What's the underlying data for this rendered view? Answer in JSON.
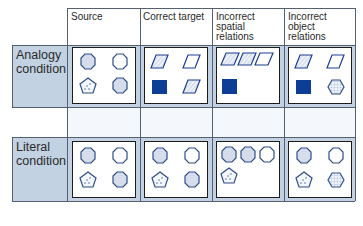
{
  "columns": [
    {
      "label": "Source"
    },
    {
      "label": "Correct target"
    },
    {
      "label": "Incorrect\nspatial\nrelations",
      "lines": [
        "Incorrect",
        "spatial",
        "relations"
      ]
    },
    {
      "label": "Incorrect\nobject\nrelations",
      "lines": [
        "Incorrect",
        "object",
        "relations"
      ]
    }
  ],
  "rows": [
    {
      "label_lines": [
        "Analogy",
        "condition"
      ],
      "panels": [
        {
          "column": "Source",
          "shapes": [
            "octagon-dotted",
            "octagon-empty",
            "pentagon-dots",
            "octagon-dotted"
          ]
        },
        {
          "column": "Correct target",
          "shapes": [
            "parallelogram-striped",
            "parallelogram-empty",
            "square-filled",
            "parallelogram-striped"
          ]
        },
        {
          "column": "Incorrect spatial relations",
          "shapes": [
            "parallelogram-striped",
            "parallelogram-striped",
            "parallelogram-empty",
            "square-filled"
          ]
        },
        {
          "column": "Incorrect object relations",
          "shapes": [
            "parallelogram-striped",
            "parallelogram-empty",
            "square-filled",
            "hexagon-grid"
          ]
        }
      ]
    },
    {
      "label_lines": [
        "Literal",
        "condition"
      ],
      "panels": [
        {
          "column": "Source",
          "shapes": [
            "octagon-dotted",
            "octagon-empty",
            "pentagon-dots",
            "octagon-dotted"
          ]
        },
        {
          "column": "Correct target",
          "shapes": [
            "octagon-dotted",
            "octagon-empty",
            "pentagon-dots",
            "octagon-dotted"
          ]
        },
        {
          "column": "Incorrect spatial relations",
          "shapes": [
            "octagon-dotted",
            "octagon-dotted",
            "octagon-empty",
            "pentagon-dots"
          ]
        },
        {
          "column": "Incorrect object relations",
          "shapes": [
            "octagon-dotted",
            "octagon-empty",
            "pentagon-dots",
            "hexagon-grid"
          ]
        }
      ]
    }
  ],
  "colors": {
    "row_background": "#c3d2e3",
    "shape_stroke": "#2f4d86",
    "filled_square": "#0d3e96",
    "parallelogram_stroke": "#1c3f93",
    "grid_lines": "#55606e"
  }
}
